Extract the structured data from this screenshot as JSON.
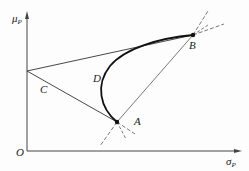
{
  "diagram": {
    "axes": {
      "y_label": "μ",
      "y_label_sub": "P",
      "x_label": "σ",
      "x_label_sub": "P",
      "origin_label": "O"
    },
    "points": {
      "A": "A",
      "B": "B",
      "C": "C",
      "D": "D"
    },
    "colors": {
      "line": "#333333",
      "curve": "#111111",
      "background": "#fdfdfd"
    }
  }
}
